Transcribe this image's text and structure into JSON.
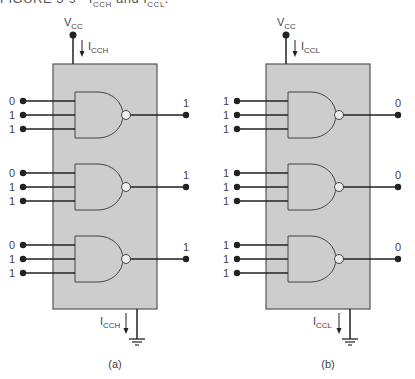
{
  "caption": "FIGURE 3-9   Iₙₙₙ and Iₙₙₙ.",
  "caption_visible": "FIGURE 3-9   I_CCH and I_CCL.",
  "colors": {
    "chip_fill": "#cdcdcd",
    "chip_border": "#555555",
    "wire": "#222222",
    "text": "#444444"
  },
  "panels": [
    {
      "id": "a",
      "label": "(a)",
      "supply_label": "V",
      "supply_sub": "CC",
      "top_current": "I",
      "top_current_sub": "CCH",
      "bottom_current": "I",
      "bottom_current_sub": "CCH",
      "gates": [
        {
          "inputs": [
            "0",
            "1",
            "1"
          ],
          "output": "1"
        },
        {
          "inputs": [
            "0",
            "1",
            "1"
          ],
          "output": "1"
        },
        {
          "inputs": [
            "0",
            "1",
            "1"
          ],
          "output": "1"
        }
      ]
    },
    {
      "id": "b",
      "label": "(b)",
      "supply_label": "V",
      "supply_sub": "CC",
      "top_current": "I",
      "top_current_sub": "CCL",
      "bottom_current": "I",
      "bottom_current_sub": "CCL",
      "gates": [
        {
          "inputs": [
            "1",
            "1",
            "1"
          ],
          "output": "0"
        },
        {
          "inputs": [
            "1",
            "1",
            "1"
          ],
          "output": "0"
        },
        {
          "inputs": [
            "1",
            "1",
            "1"
          ],
          "output": "0"
        }
      ]
    }
  ]
}
